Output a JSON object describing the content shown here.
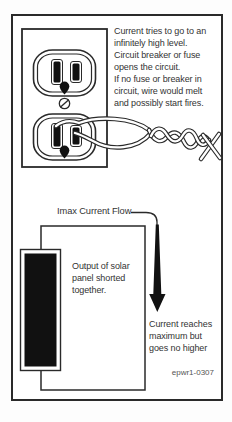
{
  "figure": {
    "outlet_caption": "Current tries to go to an\ninfinitely high level.\nCircuit breaker or fuse\nopens the circuit.\nIf no fuse or breaker in\ncircuit, wire would melt\nand possibly start fires.",
    "imax_label": "Imax Current Flow",
    "panel_caption": "Output of solar\npanel shorted\ntogether.",
    "current_max_caption": "Current reaches\nmaximum but\ngoes no higher",
    "id_label": "epwr1-0307",
    "colors": {
      "line": "#2a2a2a",
      "text": "#333333",
      "paper": "#ffffff",
      "fill_black": "#111111"
    }
  }
}
